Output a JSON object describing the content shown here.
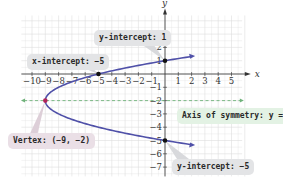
{
  "chart_data": {
    "type": "line",
    "title": "",
    "equation": "x = y^2 + 4y - 5",
    "xlabel": "x",
    "ylabel": "y",
    "xlim": [
      -11,
      6
    ],
    "ylim": [
      -8,
      4
    ],
    "grid": true,
    "x_tick_labels": [
      "-10",
      "-9",
      "-8",
      "-7",
      "-6",
      "-5",
      "-4",
      "-3",
      "-2",
      "-1",
      "1",
      "2",
      "3",
      "4",
      "5"
    ],
    "y_tick_labels": [
      "3",
      "2",
      "1",
      "-1",
      "-2",
      "-3",
      "-4",
      "-5",
      "-6",
      "-7"
    ],
    "series": [
      {
        "name": "parabola",
        "color": "#4f50a8",
        "points": [
          [
            5.84,
            1.3
          ],
          [
            0,
            1
          ],
          [
            -5,
            0
          ],
          [
            -8,
            -1
          ],
          [
            -9,
            -2
          ],
          [
            -8,
            -3
          ],
          [
            -5,
            -4
          ],
          [
            0,
            -5
          ],
          [
            5.84,
            -5.3
          ]
        ]
      },
      {
        "name": "axis of symmetry",
        "color": "#6fb27a",
        "style": "dashed",
        "points": [
          [
            -11,
            -2
          ],
          [
            6,
            -2
          ]
        ]
      }
    ],
    "key_points": [
      {
        "name": "vertex",
        "x": -9,
        "y": -2,
        "color": "#b0245a"
      },
      {
        "name": "x-intercept",
        "x": -5,
        "y": 0,
        "color": "#111111"
      },
      {
        "name": "y-intercept-1",
        "x": 0,
        "y": 1,
        "color": "#111111"
      },
      {
        "name": "y-intercept-2",
        "x": 0,
        "y": -5,
        "color": "#111111"
      }
    ],
    "annotations": [
      {
        "text": "x-intercept: −5",
        "points_to": [
          -5,
          0
        ]
      },
      {
        "text": "y-intercept: 1",
        "points_to": [
          0,
          1
        ]
      },
      {
        "text": "Vertex: (−9, −2)",
        "points_to": [
          -9,
          -2
        ]
      },
      {
        "text": "Axis of symmetry: y = −2",
        "points_to": [
          4,
          -2
        ]
      },
      {
        "text": "y-intercept: −5",
        "points_to": [
          0,
          -5
        ]
      }
    ]
  },
  "labels": {
    "x_axis": "x",
    "y_axis": "y",
    "x_intercept": "x-intercept: −5",
    "y_intercept_top": "y-intercept: 1",
    "vertex": "Vertex: (−9, −2)",
    "axis_of_symmetry": "Axis of symmetry: y = −2",
    "y_intercept_bottom": "y-intercept: −5"
  },
  "colors": {
    "curve": "#4f50a8",
    "axis_symmetry": "#6fb27a",
    "vertex": "#b0245a",
    "grid": "#dedede",
    "axes": "#333333"
  }
}
